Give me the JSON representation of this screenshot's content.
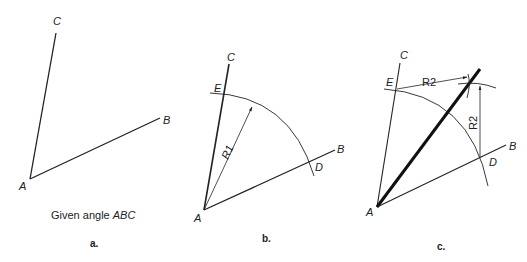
{
  "figure": {
    "panels": [
      {
        "id": "a",
        "panel_label": "a.",
        "caption_prefix": "Given angle ",
        "caption_italic": "ABC",
        "points": {
          "A": "A",
          "B": "B",
          "C": "C"
        }
      },
      {
        "id": "b",
        "panel_label": "b.",
        "points": {
          "A": "A",
          "B": "B",
          "C": "C",
          "D": "D",
          "E": "E"
        },
        "radius_label": "R1"
      },
      {
        "id": "c",
        "panel_label": "c.",
        "points": {
          "A": "A",
          "B": "B",
          "C": "C",
          "D": "D",
          "E": "E"
        },
        "radius_label_top": "R2",
        "radius_label_side": "R2"
      }
    ],
    "colors": {
      "line": "#222222",
      "background": "#ffffff"
    }
  }
}
